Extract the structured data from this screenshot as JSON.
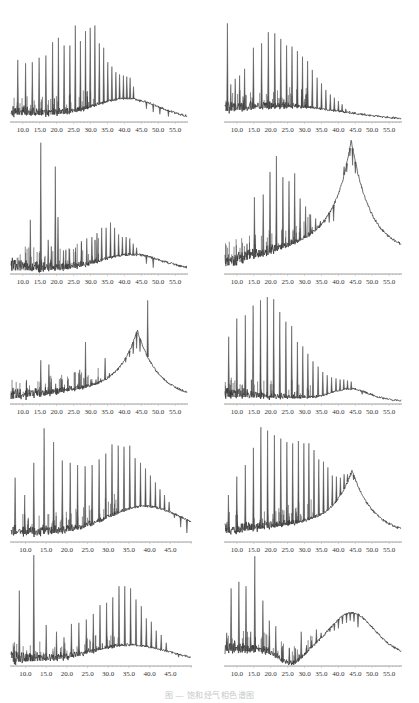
{
  "figure": {
    "caption": "图 — 饱和烃气相色谱图"
  },
  "chart_data": [
    {
      "type": "line",
      "id": "p1",
      "position": "row1-left",
      "title": "",
      "xlabel": "",
      "ylabel": "",
      "xlim": [
        6.5,
        58.5
      ],
      "xticks": [
        "10.0",
        "15.0",
        "20.0",
        "25.0",
        "30.0",
        "35.0",
        "40.0",
        "45.0",
        "50.0",
        "55.0"
      ],
      "hump": {
        "center": 41.0,
        "width": 9,
        "height": 0.17,
        "baseline_start": 0.06,
        "tail_end": 0.02
      },
      "peaks": [
        [
          8.5,
          0.55
        ],
        [
          10.8,
          0.52
        ],
        [
          12.8,
          0.53
        ],
        [
          14.8,
          0.57
        ],
        [
          16.8,
          0.59
        ],
        [
          18.8,
          0.71
        ],
        [
          20.5,
          0.75
        ],
        [
          22.2,
          0.68
        ],
        [
          23.9,
          0.68
        ],
        [
          25.5,
          0.86
        ],
        [
          27.0,
          0.72
        ],
        [
          28.5,
          0.81
        ],
        [
          29.9,
          0.84
        ],
        [
          31.3,
          0.86
        ],
        [
          32.6,
          0.7
        ],
        [
          33.9,
          0.66
        ],
        [
          35.1,
          0.53
        ],
        [
          36.3,
          0.49
        ],
        [
          37.5,
          0.44
        ],
        [
          38.6,
          0.42
        ],
        [
          39.7,
          0.41
        ],
        [
          40.7,
          0.4
        ],
        [
          41.7,
          0.39
        ],
        [
          42.7,
          0.31
        ],
        [
          44.5,
          0.17
        ],
        [
          46.5,
          0.11
        ],
        [
          48.5,
          0.08
        ],
        [
          50.5,
          0.06
        ],
        [
          53.0,
          0.04
        ]
      ]
    },
    {
      "type": "line",
      "id": "p2",
      "position": "row1-right",
      "xlim": [
        6.5,
        58.5
      ],
      "xticks": [
        "10.0",
        "15.0",
        "20.0",
        "25.0",
        "30.0",
        "35.0",
        "40.0",
        "45.0",
        "50.0",
        "55.0"
      ],
      "hump": {
        "center": 27.0,
        "width": 16,
        "height": 0.09,
        "baseline_start": 0.05,
        "tail_end": 0.01
      },
      "peaks": [
        [
          7.2,
          0.88
        ],
        [
          8.2,
          0.33
        ],
        [
          9.5,
          0.38
        ],
        [
          10.8,
          0.41
        ],
        [
          12.3,
          0.47
        ],
        [
          14.9,
          0.66
        ],
        [
          17.3,
          0.7
        ],
        [
          19.3,
          0.8
        ],
        [
          21.2,
          0.79
        ],
        [
          23.0,
          0.74
        ],
        [
          24.7,
          0.68
        ],
        [
          26.3,
          0.67
        ],
        [
          27.9,
          0.63
        ],
        [
          29.4,
          0.58
        ],
        [
          30.9,
          0.54
        ],
        [
          32.3,
          0.46
        ],
        [
          33.7,
          0.39
        ],
        [
          35.0,
          0.34
        ],
        [
          36.3,
          0.28
        ],
        [
          37.6,
          0.24
        ],
        [
          38.8,
          0.21
        ],
        [
          40.0,
          0.18
        ],
        [
          41.1,
          0.15
        ],
        [
          42.2,
          0.11
        ],
        [
          43.3,
          0.09
        ],
        [
          44.5,
          0.06
        ]
      ]
    },
    {
      "type": "line",
      "id": "p3",
      "position": "row2-left",
      "xlim": [
        6.5,
        58.5
      ],
      "xticks": [
        "10.0",
        "15.0",
        "20.0",
        "25.0",
        "30.0",
        "35.0",
        "40.0",
        "45.0",
        "50.0",
        "55.0"
      ],
      "hump": {
        "center": 42.0,
        "width": 9,
        "height": 0.12,
        "baseline_start": 0.02,
        "tail_end": 0.02
      },
      "peaks": [
        [
          12.2,
          0.4
        ],
        [
          15.3,
          0.98
        ],
        [
          17.5,
          0.25
        ],
        [
          18.4,
          0.2
        ],
        [
          19.6,
          0.8
        ],
        [
          20.4,
          0.42
        ],
        [
          22.0,
          0.17
        ],
        [
          23.8,
          0.18
        ],
        [
          25.6,
          0.19
        ],
        [
          27.3,
          0.24
        ],
        [
          28.9,
          0.26
        ],
        [
          30.4,
          0.27
        ],
        [
          31.9,
          0.3
        ],
        [
          33.3,
          0.34
        ],
        [
          34.6,
          0.34
        ],
        [
          35.9,
          0.38
        ],
        [
          37.1,
          0.34
        ],
        [
          38.3,
          0.29
        ],
        [
          39.4,
          0.27
        ],
        [
          40.5,
          0.27
        ],
        [
          41.6,
          0.26
        ],
        [
          42.6,
          0.22
        ],
        [
          43.6,
          0.19
        ],
        [
          44.8,
          0.13
        ],
        [
          46.5,
          0.07
        ],
        [
          48.5,
          0.04
        ]
      ]
    },
    {
      "type": "line",
      "id": "p4",
      "position": "row2-right",
      "xlim": [
        6.5,
        58.5
      ],
      "xticks": [
        "10.0",
        "15.0",
        "20.0",
        "25.0",
        "30.0",
        "35.0",
        "40.0",
        "45.0",
        "50.0",
        "55.0"
      ],
      "hump": {
        "center": 43.8,
        "width": 4.2,
        "height": 0.66,
        "baseline_start": 0.05,
        "tail_end": 0.14,
        "ramp": 0.22
      },
      "peaks": [
        [
          7.5,
          0.14
        ],
        [
          9.5,
          0.12
        ],
        [
          11.5,
          0.14
        ],
        [
          13.0,
          0.22
        ],
        [
          15.2,
          0.57
        ],
        [
          17.8,
          0.59
        ],
        [
          19.8,
          0.76
        ],
        [
          21.7,
          0.88
        ],
        [
          23.6,
          0.72
        ],
        [
          25.4,
          0.69
        ],
        [
          27.1,
          0.75
        ],
        [
          28.7,
          0.56
        ],
        [
          30.3,
          0.5
        ],
        [
          31.8,
          0.44
        ],
        [
          33.3,
          0.41
        ],
        [
          34.7,
          0.39
        ],
        [
          36.0,
          0.38
        ],
        [
          37.3,
          0.38
        ],
        [
          38.6,
          0.39
        ],
        [
          41.7,
          0.8
        ],
        [
          42.5,
          0.76
        ],
        [
          43.4,
          0.88
        ],
        [
          44.2,
          0.81
        ],
        [
          45.0,
          0.75
        ],
        [
          46.9,
          0.64
        ]
      ]
    },
    {
      "type": "line",
      "id": "p5",
      "position": "row3-left",
      "xlim": [
        6.5,
        58.5
      ],
      "xticks": [
        "10.0",
        "15.0",
        "20.0",
        "25.0",
        "30.0",
        "35.0",
        "40.0",
        "45.0",
        "50.0",
        "55.0"
      ],
      "hump": {
        "center": 43.8,
        "width": 4.5,
        "height": 0.5,
        "baseline_start": 0.04,
        "tail_end": 0.04,
        "ramp": 0.14
      },
      "peaks": [
        [
          7.0,
          0.14
        ],
        [
          9.0,
          0.08
        ],
        [
          11.3,
          0.14
        ],
        [
          13.0,
          0.12
        ],
        [
          15.3,
          0.4
        ],
        [
          17.7,
          0.36
        ],
        [
          19.7,
          0.18
        ],
        [
          21.5,
          0.22
        ],
        [
          23.2,
          0.13
        ],
        [
          25.1,
          0.13
        ],
        [
          26.8,
          0.31
        ],
        [
          28.5,
          0.57
        ],
        [
          30.1,
          0.22
        ],
        [
          31.6,
          0.22
        ],
        [
          33.0,
          0.23
        ],
        [
          34.3,
          0.42
        ],
        [
          35.6,
          0.28
        ],
        [
          36.9,
          0.29
        ],
        [
          38.1,
          0.31
        ],
        [
          39.3,
          0.37
        ],
        [
          40.4,
          0.38
        ],
        [
          41.5,
          0.43
        ],
        [
          42.6,
          0.46
        ],
        [
          43.6,
          0.51
        ],
        [
          44.6,
          0.48
        ],
        [
          46.9,
          0.96
        ]
      ]
    },
    {
      "type": "line",
      "id": "p6",
      "position": "row3-right",
      "xlim": [
        6.5,
        58.5
      ],
      "xticks": [
        "10.0",
        "15.0",
        "20.0",
        "25.0",
        "30.0",
        "35.0",
        "40.0",
        "45.0",
        "50.0",
        "55.0"
      ],
      "hump": {
        "center": 43.5,
        "width": 5.5,
        "height": 0.1,
        "baseline_start": 0.06,
        "tail_end": 0.02
      },
      "peaks": [
        [
          7.6,
          0.62
        ],
        [
          10.0,
          0.79
        ],
        [
          12.5,
          0.82
        ],
        [
          14.8,
          0.91
        ],
        [
          17.0,
          0.96
        ],
        [
          19.0,
          0.99
        ],
        [
          20.9,
          0.97
        ],
        [
          22.7,
          0.85
        ],
        [
          24.5,
          0.76
        ],
        [
          26.2,
          0.72
        ],
        [
          27.9,
          0.57
        ],
        [
          29.5,
          0.53
        ],
        [
          31.0,
          0.46
        ],
        [
          32.5,
          0.39
        ],
        [
          34.0,
          0.34
        ],
        [
          35.4,
          0.29
        ],
        [
          36.7,
          0.26
        ],
        [
          38.0,
          0.24
        ],
        [
          39.3,
          0.23
        ],
        [
          40.5,
          0.22
        ],
        [
          41.6,
          0.22
        ],
        [
          42.7,
          0.21
        ],
        [
          43.8,
          0.2
        ],
        [
          45.0,
          0.14
        ],
        [
          47.0,
          0.08
        ]
      ]
    },
    {
      "type": "line",
      "id": "p7",
      "position": "row4-left",
      "xlim": [
        6.5,
        50.0
      ],
      "xticks": [
        "10.0",
        "15.0",
        "20.0",
        "25.0",
        "30.0",
        "35.0",
        "40.0",
        "45.0"
      ],
      "hump": {
        "center": 39.0,
        "width": 9,
        "height": 0.25,
        "baseline_start": 0.06,
        "tail_end": 0.05
      },
      "peaks": [
        [
          7.5,
          0.55
        ],
        [
          9.8,
          0.4
        ],
        [
          12.0,
          0.68
        ],
        [
          14.5,
          0.98
        ],
        [
          16.8,
          0.86
        ],
        [
          18.9,
          0.7
        ],
        [
          20.8,
          0.68
        ],
        [
          22.6,
          0.66
        ],
        [
          24.4,
          0.65
        ],
        [
          26.1,
          0.66
        ],
        [
          27.8,
          0.71
        ],
        [
          29.4,
          0.76
        ],
        [
          30.9,
          0.84
        ],
        [
          32.4,
          0.83
        ],
        [
          33.8,
          0.82
        ],
        [
          35.2,
          0.83
        ],
        [
          36.5,
          0.72
        ],
        [
          37.8,
          0.68
        ],
        [
          39.0,
          0.63
        ],
        [
          40.2,
          0.57
        ],
        [
          41.4,
          0.51
        ],
        [
          42.5,
          0.45
        ],
        [
          43.6,
          0.4
        ],
        [
          44.7,
          0.34
        ],
        [
          46.0,
          0.2
        ],
        [
          47.5,
          0.12
        ],
        [
          49.0,
          0.07
        ]
      ]
    },
    {
      "type": "line",
      "id": "p8",
      "position": "row4-right",
      "xlim": [
        6.5,
        58.5
      ],
      "xticks": [
        "10.0",
        "15.0",
        "20.0",
        "25.0",
        "30.0",
        "35.0",
        "40.0",
        "45.0",
        "50.0",
        "55.0"
      ],
      "hump": {
        "center": 44.0,
        "width": 4.5,
        "height": 0.42,
        "baseline_start": 0.07,
        "tail_end": 0.05,
        "ramp": 0.14
      },
      "peaks": [
        [
          7.5,
          0.4
        ],
        [
          10.0,
          0.56
        ],
        [
          12.5,
          0.66
        ],
        [
          14.9,
          0.81
        ],
        [
          17.1,
          0.99
        ],
        [
          19.1,
          0.96
        ],
        [
          21.1,
          0.92
        ],
        [
          23.0,
          0.89
        ],
        [
          24.8,
          0.86
        ],
        [
          26.5,
          0.85
        ],
        [
          28.2,
          0.87
        ],
        [
          29.8,
          0.85
        ],
        [
          31.3,
          0.85
        ],
        [
          32.8,
          0.79
        ],
        [
          34.2,
          0.71
        ],
        [
          35.6,
          0.69
        ],
        [
          36.9,
          0.64
        ],
        [
          38.2,
          0.57
        ],
        [
          39.4,
          0.56
        ],
        [
          40.6,
          0.55
        ],
        [
          41.7,
          0.58
        ],
        [
          42.7,
          0.58
        ],
        [
          43.7,
          0.57
        ],
        [
          44.5,
          0.53
        ]
      ]
    },
    {
      "type": "line",
      "id": "p9",
      "position": "row5-left",
      "xlim": [
        6.5,
        50.0
      ],
      "xticks": [
        "10.0",
        "15.0",
        "20.0",
        "25.0",
        "30.0",
        "35.0",
        "40.0",
        "45.0"
      ],
      "hump": {
        "center": 35.5,
        "width": 9,
        "height": 0.15,
        "baseline_start": 0.03,
        "tail_end": 0.03
      },
      "peaks": [
        [
          7.2,
          0.17
        ],
        [
          8.5,
          0.67
        ],
        [
          10.5,
          0.1
        ],
        [
          12.0,
          0.99
        ],
        [
          15.0,
          0.36
        ],
        [
          17.5,
          0.3
        ],
        [
          19.3,
          0.25
        ],
        [
          21.1,
          0.37
        ],
        [
          22.9,
          0.38
        ],
        [
          24.7,
          0.41
        ],
        [
          26.4,
          0.46
        ],
        [
          28.0,
          0.54
        ],
        [
          29.6,
          0.56
        ],
        [
          31.1,
          0.61
        ],
        [
          32.6,
          0.71
        ],
        [
          34.0,
          0.71
        ],
        [
          35.4,
          0.69
        ],
        [
          36.7,
          0.59
        ],
        [
          38.0,
          0.53
        ],
        [
          39.2,
          0.42
        ],
        [
          40.4,
          0.39
        ],
        [
          41.6,
          0.31
        ],
        [
          42.8,
          0.27
        ],
        [
          44.0,
          0.2
        ],
        [
          45.4,
          0.11
        ],
        [
          47.0,
          0.07
        ]
      ]
    },
    {
      "type": "line",
      "id": "p10",
      "position": "row5-right",
      "xlim": [
        6.5,
        58.5
      ],
      "xticks": [
        "10.0",
        "15.0",
        "20.0",
        "25.0",
        "30.0",
        "35.0",
        "40.0",
        "45.0",
        "50.0",
        "55.0"
      ],
      "hump": {
        "center": 44.0,
        "width": 6.5,
        "height": 0.36,
        "baseline_start": 0.13,
        "tail_end": 0.1,
        "dip": {
          "center": 26.0,
          "depth": 0.12
        }
      },
      "peaks": [
        [
          7.0,
          0.29
        ],
        [
          8.3,
          0.69
        ],
        [
          10.6,
          0.75
        ],
        [
          12.7,
          0.71
        ],
        [
          14.1,
          0.3
        ],
        [
          15.3,
          0.98
        ],
        [
          17.7,
          0.58
        ],
        [
          19.6,
          0.4
        ],
        [
          21.5,
          0.35
        ],
        [
          23.5,
          0.17
        ],
        [
          25.5,
          0.15
        ],
        [
          27.3,
          0.15
        ],
        [
          29.0,
          0.3
        ],
        [
          30.6,
          0.18
        ],
        [
          32.1,
          0.22
        ],
        [
          33.5,
          0.32
        ],
        [
          34.9,
          0.29
        ],
        [
          36.2,
          0.29
        ],
        [
          37.5,
          0.3
        ],
        [
          38.8,
          0.31
        ],
        [
          40.0,
          0.33
        ],
        [
          41.2,
          0.37
        ],
        [
          42.4,
          0.38
        ],
        [
          43.5,
          0.4
        ],
        [
          44.6,
          0.39
        ],
        [
          45.8,
          0.34
        ]
      ]
    }
  ]
}
